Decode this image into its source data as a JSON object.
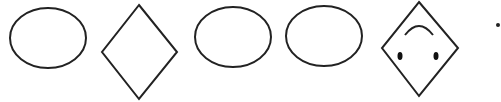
{
  "figure": {
    "stroke_color": "#222222",
    "background": "#ffffff",
    "shapes": [
      {
        "type": "ellipse",
        "cx": 48,
        "cy": 38,
        "rx": 38,
        "ry": 30
      },
      {
        "type": "diamond",
        "points": "139,5 177,52 139,99 102,52"
      },
      {
        "type": "ellipse",
        "cx": 233,
        "cy": 37,
        "rx": 38,
        "ry": 30
      },
      {
        "type": "ellipse",
        "cx": 324,
        "cy": 36,
        "rx": 38,
        "ry": 30
      },
      {
        "type": "diamond-face",
        "points": "419,2 458,48 419,96 382,48"
      },
      {
        "type": "dot",
        "cx": 498,
        "cy": 25,
        "r": 2
      }
    ]
  }
}
